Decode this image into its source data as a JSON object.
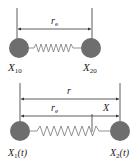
{
  "diagram": {
    "type": "two-mass spring system",
    "top_panel": {
      "dimension_label": "r_e",
      "dimension_label_main": "r",
      "dimension_label_sub": "e",
      "left_mass_label_main": "X",
      "left_mass_label_sub": "10",
      "right_mass_label_main": "X",
      "right_mass_label_sub": "20"
    },
    "bottom_panel": {
      "outer_dimension_label": "r",
      "inner_dimension_label_main": "r",
      "inner_dimension_label_sub": "e",
      "displacement_label": "X",
      "left_mass_label_main": "X",
      "left_mass_label_sub": "1",
      "left_mass_label_arg": "(t)",
      "right_mass_label_main": "X",
      "right_mass_label_sub": "2",
      "right_mass_label_arg": "(t)"
    },
    "colors": {
      "mass": "#6e6e6e",
      "spring": "#777777",
      "line": "#333333"
    }
  }
}
